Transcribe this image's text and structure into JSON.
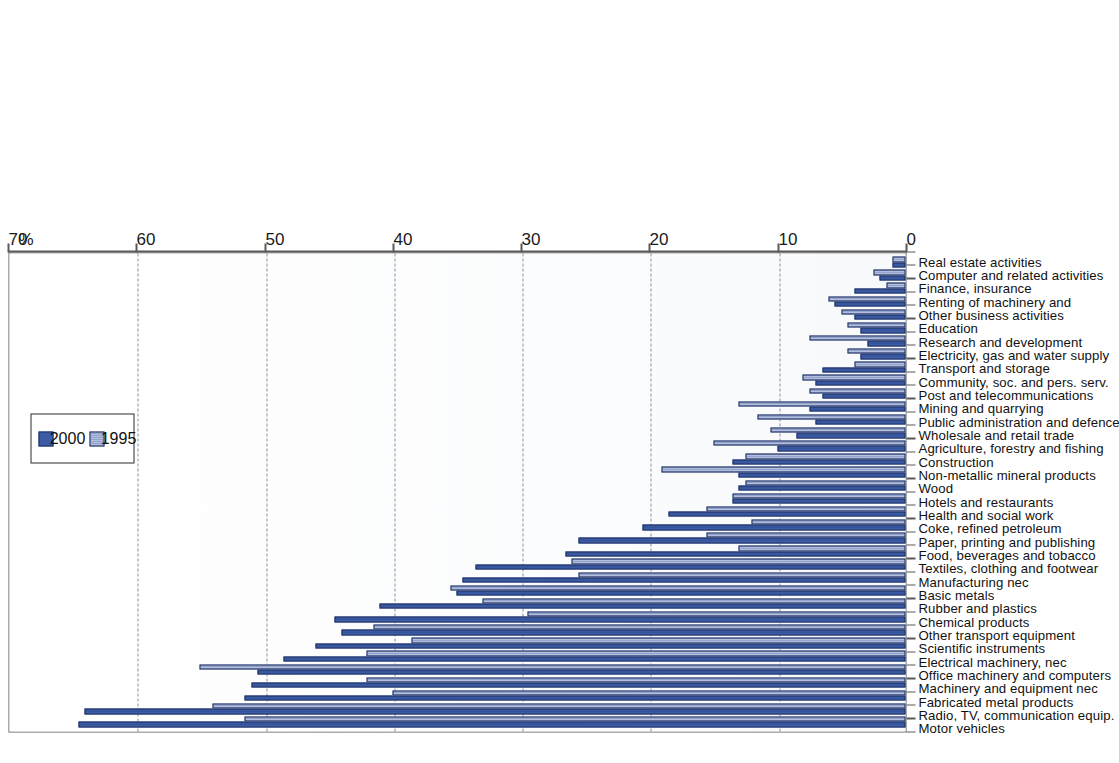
{
  "chart_data": {
    "type": "bar",
    "title": "",
    "subtitle": "",
    "xlabel": "",
    "ylabel": "%",
    "unit_label": "%",
    "orientation": "rotated-90",
    "ylim": [
      0,
      70
    ],
    "yticks": [
      0,
      10,
      20,
      30,
      40,
      50,
      60,
      70
    ],
    "grid": true,
    "gridlines_at": [
      10,
      20,
      30,
      40,
      50,
      60
    ],
    "legend_position": "top-center",
    "categories": [
      "Motor vehicles",
      "Radio, TV, communication equip.",
      "Fabricated metal products",
      "Machinery and equipment nec",
      "Office machinery and computers",
      "Electrical machinery, nec",
      "Scientific instruments",
      "Other transport equipment",
      "Chemical products",
      "Rubber and plastics",
      "Basic metals",
      "Manufacturing nec",
      "Textiles, clothing and footwear",
      "Food, beverages and tobacco",
      "Paper, printing and publishing",
      "Coke, refined petroleum",
      "Health and social work",
      "Hotels and restaurants",
      "Wood",
      "Non-metallic mineral products",
      "Construction",
      "Agriculture, forestry and fishing",
      "Wholesale and retail trade",
      "Public administration and defence",
      "Mining and quarrying",
      "Post and telecommunications",
      "Community, soc. and pers. serv.",
      "Transport and storage",
      "Electricity, gas and water supply",
      "Research and development",
      "Education",
      "Other business activities",
      "Renting of machinery and",
      "Finance, insurance",
      "Computer and related activities",
      "Real estate activities"
    ],
    "series": [
      {
        "name": "2000",
        "color": "#3c5ca4",
        "values": [
          64.5,
          64.0,
          51.5,
          51.0,
          50.5,
          48.5,
          46.0,
          44.0,
          44.5,
          41.0,
          35.0,
          34.5,
          33.5,
          26.5,
          25.5,
          20.5,
          18.5,
          13.5,
          13.0,
          13.0,
          13.5,
          10.0,
          8.5,
          7.0,
          7.5,
          6.5,
          7.0,
          6.5,
          3.5,
          3.0,
          3.5,
          4.0,
          5.5,
          4.0,
          2.0,
          1.0
        ]
      },
      {
        "name": "1995",
        "color": "#9aa8cf",
        "values": [
          51.5,
          54.0,
          40.0,
          42.0,
          55.0,
          42.0,
          38.5,
          41.5,
          29.5,
          33.0,
          35.5,
          25.5,
          26.0,
          13.0,
          15.5,
          12.0,
          15.5,
          13.5,
          12.5,
          19.0,
          12.5,
          15.0,
          10.5,
          11.5,
          13.0,
          7.5,
          8.0,
          4.0,
          4.5,
          7.5,
          4.5,
          5.0,
          6.0,
          1.5,
          2.5,
          1.0
        ]
      }
    ]
  },
  "legend": {
    "items": [
      {
        "label": "1995",
        "series": "1995"
      },
      {
        "label": "2000",
        "series": "2000"
      }
    ]
  },
  "axis": {
    "unit": "%",
    "tick_labels": [
      "0",
      "10",
      "20",
      "30",
      "40",
      "50",
      "60",
      "70"
    ]
  }
}
